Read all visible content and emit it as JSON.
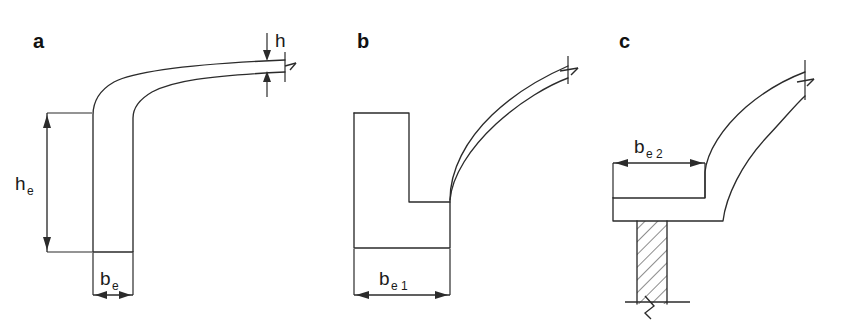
{
  "figure": {
    "background_color": "#ffffff",
    "line_color": "#2b2b2b",
    "text_color": "#1a1a1a"
  },
  "panels": [
    {
      "id": "panel-a",
      "letter": "a",
      "dimensions": [
        {
          "name": "h",
          "base": "h",
          "subscript": "",
          "orientation": "vertical",
          "position": "top-right",
          "label": "h"
        },
        {
          "name": "he",
          "base": "h",
          "subscript": "e",
          "orientation": "vertical",
          "position": "left",
          "label": "he"
        },
        {
          "name": "be",
          "base": "b",
          "subscript": "e",
          "orientation": "horizontal",
          "position": "bottom",
          "label": "be"
        }
      ]
    },
    {
      "id": "panel-b",
      "letter": "b",
      "dimensions": [
        {
          "name": "be1",
          "base": "b",
          "subscript": "e1",
          "orientation": "horizontal",
          "position": "bottom",
          "label": "be1"
        }
      ]
    },
    {
      "id": "panel-c",
      "letter": "c",
      "dimensions": [
        {
          "name": "be2",
          "base": "b",
          "subscript": "e2",
          "orientation": "horizontal",
          "position": "top",
          "label": "be2"
        }
      ]
    }
  ],
  "labels": {
    "a": "a",
    "b": "b",
    "c": "c",
    "h_base": "h",
    "h_sub": "",
    "he_base": "h",
    "he_sub": "e",
    "be_base": "b",
    "be_sub": "e",
    "be1_base": "b",
    "be1_sub": "e 1",
    "be2_base": "b",
    "be2_sub": "e 2"
  }
}
